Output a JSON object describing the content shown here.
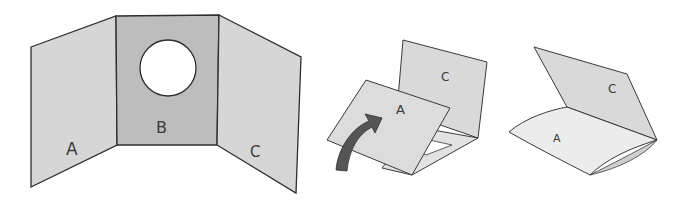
{
  "figure": {
    "colors": {
      "panel_side": "#d6d6d6",
      "panel_center": "#bdbdbd",
      "panel_light": "#e4e4e4",
      "outline": "#2e2e2e",
      "arrow": "#555555",
      "window": "#ffffff"
    },
    "step1": {
      "panels": [
        {
          "label": "A"
        },
        {
          "label": "B"
        },
        {
          "label": "C"
        }
      ]
    },
    "step2": {
      "panels": [
        {
          "label": "C"
        },
        {
          "label": "A"
        }
      ],
      "arrow": "curved-fold-arrow"
    },
    "step3": {
      "panels": [
        {
          "label": "C"
        },
        {
          "label": "A"
        }
      ]
    }
  }
}
